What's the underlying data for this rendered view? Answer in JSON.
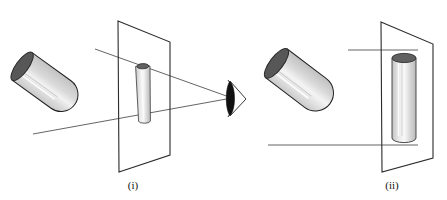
{
  "figure": {
    "title": "",
    "background_color": "#ffffff",
    "width": 447,
    "height": 200,
    "panels": [
      {
        "id": "panel-i",
        "caption": "(i)",
        "caption_x": 133,
        "caption_y": 189,
        "projection_type": "perspective-projection",
        "description": "Cylinder projected onto a picture plane by rays converging at an eye point",
        "object": {
          "name": "tilted-cylinder",
          "body_color": "#d6d6d6",
          "body_highlight_color": "#efefef",
          "cap_color": "#575757",
          "outline_color": "#222222",
          "axis_start": [
            33,
            133
          ],
          "axis_end": [
            89,
            56
          ],
          "radius": 17
        },
        "plane": {
          "name": "picture-plane",
          "outline_color": "#2b2b2b",
          "corners": [
            [
              118,
              21
            ],
            [
              170,
              42
            ],
            [
              170,
              155
            ],
            [
              119,
              172
            ]
          ]
        },
        "image": {
          "name": "projected-cylinder-image",
          "body_color": "#d6d6d6",
          "body_highlight_color": "#f2f2f2",
          "cap_color": "#606060",
          "outline_color": "#3a3a3a",
          "axis_start": [
            141,
            121
          ],
          "axis_end": [
            144,
            66
          ],
          "radius": 6
        },
        "eye": {
          "name": "eye-point",
          "x": 232,
          "y": 98,
          "pupil_color": "#111111",
          "outline_color": "#444444"
        },
        "rays": [
          {
            "from": [
              95,
              49
            ],
            "to": [
              232,
              98
            ]
          },
          {
            "from": [
              33,
              134
            ],
            "to": [
              232,
              98
            ]
          }
        ]
      },
      {
        "id": "panel-ii",
        "caption": "(ii)",
        "caption_x": 392,
        "caption_y": 189,
        "projection_type": "parallel-projection",
        "description": "Cylinder projected onto a picture plane by parallel horizontal rays",
        "object": {
          "name": "tilted-cylinder",
          "body_color": "#d6d6d6",
          "body_highlight_color": "#efefef",
          "cap_color": "#575757",
          "outline_color": "#222222",
          "axis_start": [
            286,
            132
          ],
          "axis_end": [
            345,
            54
          ],
          "radius": 18
        },
        "plane": {
          "name": "picture-plane",
          "outline_color": "#2b2b2b",
          "corners": [
            [
              381,
              22
            ],
            [
              433,
              44
            ],
            [
              433,
              158
            ],
            [
              382,
              172
            ]
          ]
        },
        "image": {
          "name": "projected-cylinder-image",
          "body_color": "#d6d6d6",
          "body_highlight_color": "#f2f2f2",
          "cap_color": "#606060",
          "outline_color": "#3a3a3a",
          "axis_start": [
            404,
            138
          ],
          "axis_end": [
            404,
            58
          ],
          "radius": 12
        },
        "rays": [
          {
            "from": [
              268,
              145
            ],
            "to": [
              418,
              145
            ]
          },
          {
            "from": [
              348,
              50
            ],
            "to": [
              418,
              50
            ]
          }
        ]
      }
    ]
  }
}
